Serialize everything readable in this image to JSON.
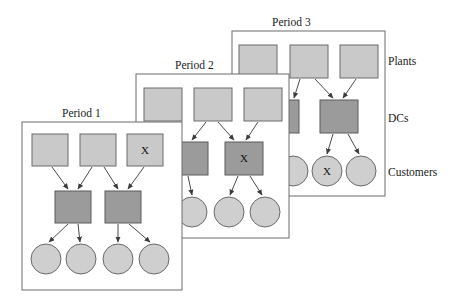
{
  "figure": {
    "background_color": "#ffffff",
    "width": 456,
    "height": 304
  },
  "colors": {
    "plant_fill": "#c9c9c9",
    "dc_fill": "#9b9b9b",
    "customer_fill": "#cfcfcf",
    "node_stroke": "#6a6a6a",
    "panel_stroke": "#6d6d6d",
    "edge_stroke": "#4a4a4a",
    "text": "#1a1a1a"
  },
  "tier_labels": [
    {
      "name": "plants-label",
      "text": "Plants",
      "x": 388,
      "y": 65
    },
    {
      "name": "dcs-label",
      "text": "DCs",
      "x": 388,
      "y": 122
    },
    {
      "name": "customers-label",
      "text": "Customers",
      "x": 388,
      "y": 176
    }
  ],
  "periods": [
    {
      "id": "period-3",
      "title": "Period 3",
      "title_x": 272,
      "title_y": 26,
      "panel": {
        "x": 232,
        "y": 31,
        "w": 153,
        "h": 165
      },
      "plants": [
        {
          "id": "p3-plant-1",
          "x": 239,
          "y": 45,
          "w": 38,
          "h": 33,
          "mark": ""
        },
        {
          "id": "p3-plant-2",
          "x": 290,
          "y": 45,
          "w": 38,
          "h": 33,
          "mark": ""
        },
        {
          "id": "p3-plant-3",
          "x": 340,
          "y": 45,
          "w": 38,
          "h": 33,
          "mark": ""
        }
      ],
      "dcs": [
        {
          "id": "p3-dc-1",
          "x": 287,
          "y": 100,
          "w": 12,
          "h": 33,
          "mark": ""
        },
        {
          "id": "p3-dc-2",
          "x": 320,
          "y": 100,
          "w": 38,
          "h": 33,
          "mark": ""
        }
      ],
      "customers": [
        {
          "id": "p3-cust-1",
          "cx": 293,
          "cy": 171,
          "r": 15,
          "mark": ""
        },
        {
          "id": "p3-cust-2",
          "cx": 327,
          "cy": 171,
          "r": 15,
          "mark": "X"
        },
        {
          "id": "p3-cust-3",
          "cx": 361,
          "cy": 171,
          "r": 15,
          "mark": ""
        }
      ],
      "edges": [
        {
          "from": "p3-plant-2",
          "to": "p3-dc-1",
          "x1": 300,
          "y1": 79,
          "x2": 294,
          "y2": 98
        },
        {
          "from": "p3-plant-2",
          "to": "p3-dc-2",
          "x1": 315,
          "y1": 79,
          "x2": 333,
          "y2": 98
        },
        {
          "from": "p3-plant-3",
          "to": "p3-dc-2",
          "x1": 356,
          "y1": 79,
          "x2": 343,
          "y2": 98
        },
        {
          "from": "p3-dc-2",
          "to": "p3-cust-2",
          "x1": 333,
          "y1": 134,
          "x2": 327,
          "y2": 154
        },
        {
          "from": "p3-dc-2",
          "to": "p3-cust-3",
          "x1": 348,
          "y1": 134,
          "x2": 359,
          "y2": 154
        }
      ]
    },
    {
      "id": "period-2",
      "title": "Period 2",
      "title_x": 175,
      "title_y": 69,
      "panel": {
        "x": 136,
        "y": 74,
        "w": 153,
        "h": 164
      },
      "plants": [
        {
          "id": "p2-plant-1",
          "x": 144,
          "y": 88,
          "w": 38,
          "h": 33,
          "mark": ""
        },
        {
          "id": "p2-plant-2",
          "x": 194,
          "y": 88,
          "w": 38,
          "h": 33,
          "mark": ""
        },
        {
          "id": "p2-plant-3",
          "x": 244,
          "y": 88,
          "w": 38,
          "h": 33,
          "mark": ""
        }
      ],
      "dcs": [
        {
          "id": "p2-dc-1",
          "x": 176,
          "y": 142,
          "w": 32,
          "h": 33,
          "mark": ""
        },
        {
          "id": "p2-dc-2",
          "x": 225,
          "y": 142,
          "w": 38,
          "h": 33,
          "mark": "X"
        }
      ],
      "customers": [
        {
          "id": "p2-cust-1",
          "cx": 192,
          "cy": 212,
          "r": 15,
          "mark": ""
        },
        {
          "id": "p2-cust-2",
          "cx": 229,
          "cy": 212,
          "r": 15,
          "mark": ""
        },
        {
          "id": "p2-cust-3",
          "cx": 265,
          "cy": 212,
          "r": 15,
          "mark": ""
        }
      ],
      "edges": [
        {
          "from": "p2-plant-1",
          "to": "p2-dc-1",
          "x1": 166,
          "y1": 122,
          "x2": 180,
          "y2": 140
        },
        {
          "from": "p2-plant-2",
          "to": "p2-dc-1",
          "x1": 206,
          "y1": 122,
          "x2": 192,
          "y2": 140
        },
        {
          "from": "p2-plant-2",
          "to": "p2-dc-2",
          "x1": 218,
          "y1": 122,
          "x2": 234,
          "y2": 140
        },
        {
          "from": "p2-plant-3",
          "to": "p2-dc-2",
          "x1": 258,
          "y1": 122,
          "x2": 246,
          "y2": 140
        },
        {
          "from": "p2-dc-1",
          "to": "p2-cust-1",
          "x1": 188,
          "y1": 176,
          "x2": 192,
          "y2": 195
        },
        {
          "from": "p2-dc-2",
          "to": "p2-cust-2",
          "x1": 238,
          "y1": 176,
          "x2": 230,
          "y2": 195
        },
        {
          "from": "p2-dc-2",
          "to": "p2-cust-3",
          "x1": 250,
          "y1": 176,
          "x2": 262,
          "y2": 195
        }
      ]
    },
    {
      "id": "period-1",
      "title": "Period 1",
      "title_x": 62,
      "title_y": 117,
      "panel": {
        "x": 22,
        "y": 122,
        "w": 160,
        "h": 168
      },
      "plants": [
        {
          "id": "p1-plant-1",
          "x": 32,
          "y": 134,
          "w": 36,
          "h": 32,
          "mark": ""
        },
        {
          "id": "p1-plant-2",
          "x": 80,
          "y": 134,
          "w": 36,
          "h": 32,
          "mark": ""
        },
        {
          "id": "p1-plant-3",
          "x": 127,
          "y": 134,
          "w": 36,
          "h": 32,
          "mark": "X"
        }
      ],
      "dcs": [
        {
          "id": "p1-dc-1",
          "x": 55,
          "y": 191,
          "w": 36,
          "h": 32,
          "mark": ""
        },
        {
          "id": "p1-dc-2",
          "x": 105,
          "y": 191,
          "w": 36,
          "h": 32,
          "mark": ""
        }
      ],
      "customers": [
        {
          "id": "p1-cust-1",
          "cx": 46,
          "cy": 259,
          "r": 15,
          "mark": ""
        },
        {
          "id": "p1-cust-2",
          "cx": 81,
          "cy": 259,
          "r": 15,
          "mark": ""
        },
        {
          "id": "p1-cust-3",
          "cx": 118,
          "cy": 259,
          "r": 15,
          "mark": ""
        },
        {
          "id": "p1-cust-4",
          "cx": 154,
          "cy": 259,
          "r": 15,
          "mark": ""
        }
      ],
      "edges": [
        {
          "from": "p1-plant-1",
          "to": "p1-dc-1",
          "x1": 52,
          "y1": 167,
          "x2": 68,
          "y2": 189
        },
        {
          "from": "p1-plant-2",
          "to": "p1-dc-1",
          "x1": 92,
          "y1": 167,
          "x2": 78,
          "y2": 189
        },
        {
          "from": "p1-plant-2",
          "to": "p1-dc-2",
          "x1": 104,
          "y1": 167,
          "x2": 118,
          "y2": 189
        },
        {
          "from": "p1-plant-3",
          "to": "p1-dc-2",
          "x1": 144,
          "y1": 167,
          "x2": 128,
          "y2": 189
        },
        {
          "from": "p1-dc-1",
          "to": "p1-cust-1",
          "x1": 68,
          "y1": 224,
          "x2": 49,
          "y2": 242
        },
        {
          "from": "p1-dc-1",
          "to": "p1-cust-2",
          "x1": 78,
          "y1": 224,
          "x2": 80,
          "y2": 242
        },
        {
          "from": "p1-dc-2",
          "to": "p1-cust-3",
          "x1": 118,
          "y1": 224,
          "x2": 118,
          "y2": 242
        },
        {
          "from": "p1-dc-2",
          "to": "p1-cust-4",
          "x1": 129,
          "y1": 224,
          "x2": 150,
          "y2": 242
        }
      ]
    }
  ]
}
